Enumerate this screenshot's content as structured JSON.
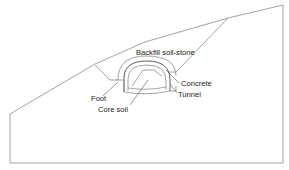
{
  "diagram": {
    "type": "tunnel cross-section in slope",
    "labels": {
      "backfill": "Backfill soil-stone",
      "concrete": "Concrete",
      "tunnel": "Tunnel",
      "foot": "Foot",
      "core_soil": "Core soil"
    },
    "colors": {
      "outline": "#8c8c8c",
      "lining": "#4a4a4a",
      "text": "#222222",
      "background": "#ffffff"
    }
  }
}
